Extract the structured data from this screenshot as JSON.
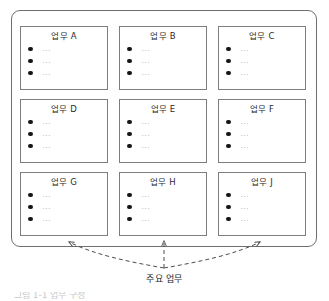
{
  "diagram": {
    "outer_container_name": "업무 그룹",
    "cards": [
      {
        "title": "업무 A",
        "items": [
          "...",
          "...",
          "..."
        ]
      },
      {
        "title": "업무 B",
        "items": [
          "...",
          "...",
          "..."
        ]
      },
      {
        "title": "업무 C",
        "items": [
          "...",
          "...",
          "..."
        ]
      },
      {
        "title": "업무 D",
        "items": [
          "...",
          "...",
          "..."
        ]
      },
      {
        "title": "업무 E",
        "items": [
          "...",
          "...",
          "..."
        ]
      },
      {
        "title": "업무 F",
        "items": [
          "...",
          "...",
          "..."
        ]
      },
      {
        "title": "업무 G",
        "items": [
          "...",
          "...",
          "..."
        ]
      },
      {
        "title": "업무 H",
        "items": [
          "...",
          "...",
          "..."
        ]
      },
      {
        "title": "업무 J",
        "items": [
          "...",
          "...",
          "..."
        ]
      }
    ],
    "callout": {
      "label": "주요 업무",
      "arrow_style": "dashed",
      "arrow_targets": [
        "업무 G",
        "업무 H",
        "업무 J"
      ]
    },
    "caption_fragment": "그림 1-1 업무 구성",
    "colors": {
      "outer_border": "#6e6e6e",
      "card_border": "#7d7d7d",
      "card_fill": "#ffffff",
      "bullet": "#161616",
      "item_text": "#a9a9a9",
      "title_text": "#2b2b2b",
      "arrow": "#4d4d4d",
      "page_background": "#ffffff"
    }
  }
}
